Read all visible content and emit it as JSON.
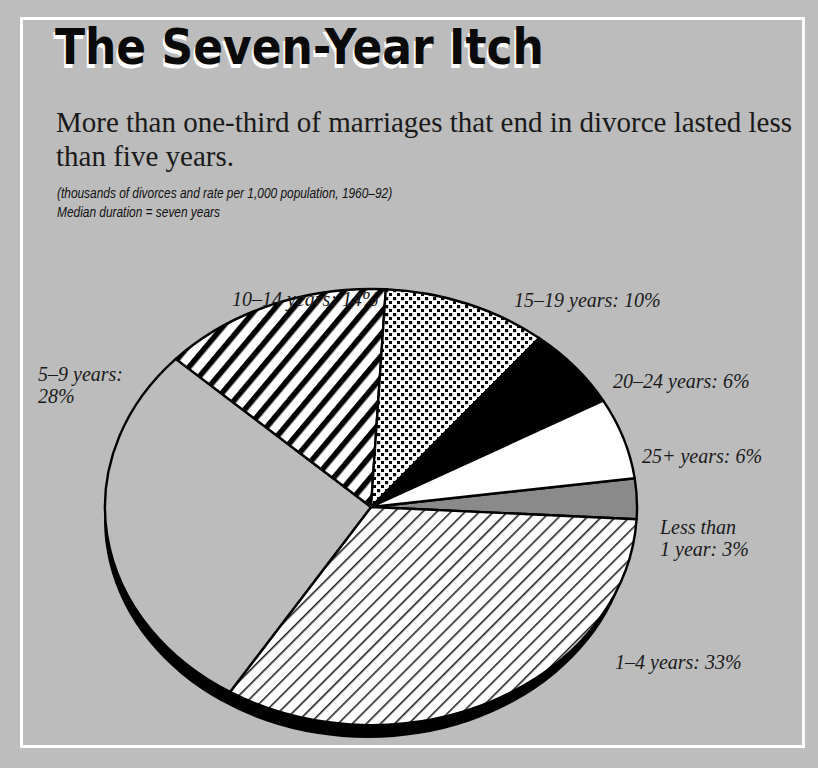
{
  "header": {
    "title": "The Seven-Year Itch",
    "subtitle": "More than one-third of marriages that end in divorce lasted less than five years.",
    "note_units": "(thousands of divorces and rate per 1,000 population, 1960–92)",
    "note_median": "Median duration = seven years"
  },
  "colors": {
    "background": "#bdbdbd",
    "frame_border": "#ffffff",
    "outline": "#000000",
    "slice_5_9": "#bcbcbc",
    "slice_less_1": "#8a8a8a",
    "slice_25_plus": "#ffffff",
    "slice_20_24": "#000000"
  },
  "labels": {
    "y10_14": "10–14 years: 14%",
    "y15_19": "15–19 years: 10%",
    "y5_9_a": "5–9 years:",
    "y5_9_b": "28%",
    "y20_24": "20–24 years: 6%",
    "y25_plus": "25+ years: 6%",
    "less1_a": "Less than",
    "less1_b": "1 year: 3%",
    "y1_4": "1–4 years: 33%"
  },
  "chart_data": {
    "type": "pie",
    "title": "The Seven-Year Itch",
    "subtitle": "More than one-third of marriages that end in divorce lasted less than five years.",
    "notes": [
      "(thousands of divorces and rate per 1,000 population, 1960–92)",
      "Median duration = seven years"
    ],
    "categories": [
      "Less than 1 year",
      "1–4 years",
      "5–9 years",
      "10–14 years",
      "15–19 years",
      "20–24 years",
      "25+ years"
    ],
    "values": [
      3,
      33,
      28,
      14,
      10,
      6,
      6
    ],
    "unit": "%",
    "slice_fills": {
      "Less than 1 year": "dark gray",
      "1–4 years": "fine diagonal hatch",
      "5–9 years": "gray (background)",
      "10–14 years": "bold diagonal stripes",
      "15–19 years": "dot pattern",
      "20–24 years": "solid black",
      "25+ years": "white"
    },
    "style": "3D tilted pie with shadow",
    "legend": "none (direct labels)"
  }
}
